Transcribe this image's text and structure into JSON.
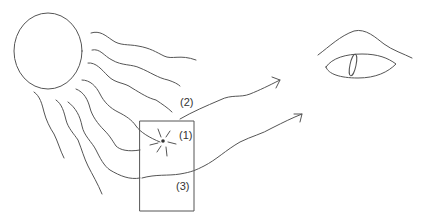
{
  "diagram": {
    "title": "",
    "elements": {
      "source": "sun-circle",
      "medium": "rectangle-block",
      "observer": "eye"
    },
    "labels": {
      "one": "(1)",
      "two": "(2)",
      "three": "(3)"
    },
    "colors": {
      "stroke": "#555555",
      "background": "#ffffff"
    }
  }
}
